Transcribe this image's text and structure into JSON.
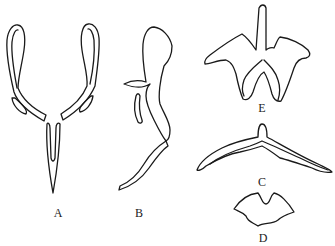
{
  "figure": {
    "background": "#ffffff",
    "stroke_color": "#1a1a1a",
    "panels": [
      {
        "id": "A",
        "label": "A",
        "description": "paired looped arms with median forked stalk"
      },
      {
        "id": "B",
        "label": "B",
        "description": "lateral view of curved sclerite with elongate tail"
      },
      {
        "id": "C",
        "label": "C",
        "description": "arched transverse bar with median knob"
      },
      {
        "id": "D",
        "label": "D",
        "description": "small bilobed plate"
      },
      {
        "id": "E",
        "label": "E",
        "description": "winged sclerite with median rod and U-shaped fork"
      }
    ]
  }
}
